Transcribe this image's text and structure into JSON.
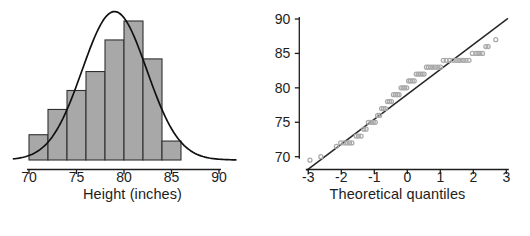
{
  "figure": {
    "background": "#ffffff",
    "panels": [
      "histogram",
      "qq-plot"
    ]
  },
  "chart_data": [
    {
      "type": "bar",
      "name": "histogram",
      "title": "",
      "xlabel": "Height (inches)",
      "ylabel": "",
      "xlim": [
        68.2,
        92.0
      ],
      "ylim": [
        0,
        30
      ],
      "grid": false,
      "legend": null,
      "bin_width": 2,
      "bin_edges": [
        70,
        72,
        74,
        76,
        78,
        80,
        82,
        84,
        86
      ],
      "categories": [
        "70-72",
        "72-74",
        "74-76",
        "76-78",
        "78-80",
        "80-82",
        "82-84",
        "84-86"
      ],
      "values": [
        4,
        8,
        11,
        14,
        19,
        22,
        16,
        3
      ],
      "bar_fill": "#a8a8a8",
      "bar_edge": "#303030",
      "xticks": [
        70,
        75,
        80,
        85,
        90
      ],
      "xticklabels": [
        "70",
        "75",
        "80",
        "85",
        "90"
      ],
      "overlay": {
        "type": "line",
        "name": "normal density curve",
        "color": "#111111",
        "mean": 79.0,
        "sd": 3.4,
        "peak_value": 23.5
      }
    },
    {
      "type": "scatter",
      "name": "qq-plot",
      "title": "",
      "xlabel": "Theoretical quantiles",
      "ylabel": "",
      "xlim": [
        -3.2,
        3.2
      ],
      "ylim": [
        68.2,
        91.0
      ],
      "grid": false,
      "legend": null,
      "xticks": [
        -3,
        -2,
        -1,
        0,
        1,
        2,
        3
      ],
      "xticklabels": [
        "-3",
        "-2",
        "-1",
        "0",
        "1",
        "2",
        "3"
      ],
      "yticks": [
        70,
        75,
        80,
        85,
        90
      ],
      "yticklabels": [
        "70",
        "75",
        "80",
        "85",
        "90"
      ],
      "point_color": "#a9a9a9",
      "point_marker": "open-circle",
      "reference_line": {
        "color": "#262626",
        "slope": 3.62,
        "intercept": 79.05,
        "x_from": -3.05,
        "x_to": 3.05
      },
      "x": [
        -2.95,
        -2.62,
        -2.15,
        -2.02,
        -1.92,
        -1.83,
        -1.75,
        -1.68,
        -1.55,
        -1.48,
        -1.4,
        -1.32,
        -1.25,
        -1.18,
        -1.1,
        -1.03,
        -0.97,
        -0.9,
        -0.84,
        -0.78,
        -0.72,
        -0.66,
        -0.6,
        -0.54,
        -0.48,
        -0.42,
        -0.36,
        -0.3,
        -0.25,
        -0.19,
        -0.13,
        -0.08,
        -0.02,
        0.04,
        0.09,
        0.15,
        0.21,
        0.27,
        0.33,
        0.39,
        0.45,
        0.51,
        0.58,
        0.64,
        0.71,
        0.78,
        0.85,
        0.93,
        1.01,
        1.09,
        1.18,
        1.28,
        1.39,
        1.48,
        1.56,
        1.63,
        1.7,
        1.78,
        1.87,
        1.97,
        2.08,
        2.14,
        2.2,
        2.28,
        2.38,
        2.45,
        2.68
      ],
      "y": [
        69.5,
        70.0,
        71.5,
        72.0,
        72.0,
        72.0,
        72.0,
        72.0,
        73.0,
        73.0,
        73.0,
        74.0,
        74.0,
        75.0,
        75.0,
        75.0,
        75.0,
        76.0,
        76.0,
        77.0,
        77.0,
        77.0,
        78.0,
        78.0,
        78.0,
        79.0,
        79.0,
        79.0,
        79.0,
        80.0,
        80.0,
        80.0,
        80.0,
        81.0,
        81.0,
        81.0,
        81.0,
        82.0,
        82.0,
        82.0,
        82.0,
        82.0,
        83.0,
        83.0,
        83.0,
        83.0,
        83.0,
        83.0,
        83.0,
        84.0,
        84.0,
        84.0,
        84.0,
        84.0,
        84.0,
        84.0,
        84.0,
        84.0,
        84.0,
        85.0,
        85.0,
        85.0,
        85.0,
        85.0,
        86.0,
        86.0,
        87.0
      ]
    }
  ],
  "histogram": {
    "xlabel": "Height (inches)",
    "xticklabels": [
      "70",
      "75",
      "80",
      "85",
      "90"
    ]
  },
  "qq": {
    "xlabel": "Theoretical quantiles",
    "xticklabels": [
      "-3",
      "-2",
      "-1",
      "0",
      "1",
      "2",
      "3"
    ],
    "yticklabels": [
      "90",
      "85",
      "80",
      "75",
      "70"
    ]
  }
}
